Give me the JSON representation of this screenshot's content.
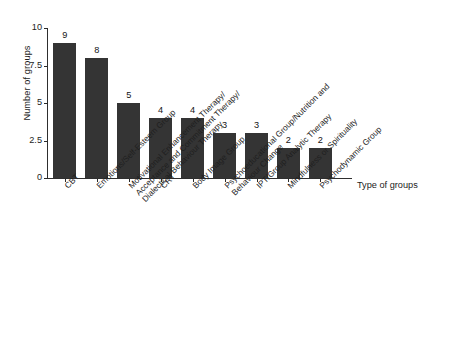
{
  "chart_data": {
    "type": "bar",
    "title": "",
    "subtitle": "",
    "xlabel": "Type of groups",
    "ylabel": "Number of groups",
    "ylim": [
      0,
      10
    ],
    "yticks": [
      "0",
      "2.5",
      "5",
      "7.5",
      "10"
    ],
    "ytick_values": [
      0,
      2.5,
      5,
      7.5,
      10
    ],
    "grid": false,
    "legend": false,
    "legend_position": "none",
    "bar_color": "#343434",
    "background_color": "#ffffff",
    "categories": [
      "CBT",
      "Emotions/Self-Esteem Group",
      "Motivational Enhancement Therapy/ Acceptance and Commitment Therapy/ Dialectical Behaviour Therapy",
      "CRT",
      "Body Image Group",
      "Psychoeducational Group/Nutrition and Behaviour Change",
      "IPT/Group Analytic Therapy",
      "Mindfulness or Spirituality",
      "Psychodynamic Group"
    ],
    "category_lines": [
      [
        "CBT"
      ],
      [
        "Emotions/Self-Esteem Group"
      ],
      [
        "Motivational Enhancement Therapy/",
        "Acceptance and Commitment Therapy/",
        "Dialectical Behaviour Therapy"
      ],
      [
        "CRT"
      ],
      [
        "Body Image Group"
      ],
      [
        "Psychoeducational Group/Nutrition and",
        "Behaviour Change"
      ],
      [
        "IPT/Group Analytic Therapy"
      ],
      [
        "Mindfulness or Spirituality"
      ],
      [
        "Psychodynamic Group"
      ]
    ],
    "values": [
      9,
      8,
      5,
      4,
      4,
      3,
      3,
      2,
      2
    ],
    "value_labels": [
      "9",
      "8",
      "5",
      "4",
      "4",
      "3",
      "3",
      "2",
      "2"
    ]
  },
  "caption": {
    "text": ""
  }
}
